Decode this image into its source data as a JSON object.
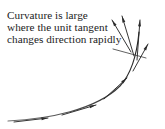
{
  "figure": {
    "title": "Curvature is large where the unit tangent changes direction rapidly",
    "background_color": "#ffffff",
    "ink_color": "#2b2b2b",
    "caption": {
      "lines": [
        "Curvature is large",
        "where the unit tangent",
        "changes direction rapidly"
      ],
      "text_color": "#1b1b1b"
    },
    "leader_line": {
      "label": "leader-line",
      "from_x": 113,
      "from_y": 49,
      "to_x": 146,
      "to_y": 58,
      "color": "#3a3a3a"
    },
    "curve": {
      "label": "parametric-curve",
      "color": "#2b2b2b",
      "path": "M 8 121 C 48 119 96 110 120 86 C 132 73 137 54 139 32",
      "description": "Smooth curve that is nearly straight at the left and bends sharply upward at the right"
    },
    "tangent_vectors": [
      {
        "name": "tangent-vector-1",
        "x1": 14,
        "y1": 122,
        "x2": 48,
        "y2": 118,
        "head_angle": -7
      },
      {
        "name": "tangent-vector-2",
        "x1": 62,
        "y1": 115,
        "x2": 96,
        "y2": 105,
        "head_angle": -17
      },
      {
        "name": "tangent-vector-3",
        "x1": 104,
        "y1": 99,
        "x2": 127,
        "y2": 78,
        "head_angle": -42
      },
      {
        "name": "tangent-vector-4",
        "x1": 133,
        "y1": 71,
        "x2": 148,
        "y2": 44,
        "head_angle": -61
      },
      {
        "name": "tangent-vector-5",
        "x1": 137,
        "y1": 60,
        "x2": 140,
        "y2": 20,
        "head_angle": -86
      },
      {
        "name": "tangent-vector-6",
        "x1": 134,
        "y1": 56,
        "x2": 122,
        "y2": 16,
        "head_angle": -107
      },
      {
        "name": "tangent-vector-7",
        "x1": 131,
        "y1": 52,
        "x2": 112,
        "y2": 20,
        "head_angle": -121
      }
    ]
  }
}
